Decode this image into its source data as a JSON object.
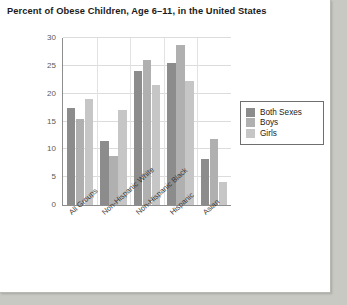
{
  "page": {
    "title": "Percent of Obese Children, Age 6–11, in the United States",
    "background": "#ffffff"
  },
  "chart_data": {
    "type": "bar",
    "title": "Percent of Obese Children, Age 6–11, in the United States",
    "xlabel": "",
    "ylabel": "",
    "ylim": [
      0,
      30
    ],
    "yticks": [
      0,
      5,
      10,
      15,
      20,
      25,
      30
    ],
    "ytick_labels": [
      "0",
      "5",
      "10",
      "15",
      "20",
      "25",
      "30"
    ],
    "grid": true,
    "legend_position": "right",
    "categories": [
      "All Groups",
      "Non-Hispanic White",
      "Non-Hispanic Black",
      "Hispanic",
      "Asian"
    ],
    "series": [
      {
        "name": "Both Sexes",
        "color": "#8c8c8c",
        "values": [
          17.5,
          11.5,
          24.0,
          25.5,
          8.3
        ]
      },
      {
        "name": "Boys",
        "color": "#b0b0b0",
        "values": [
          15.5,
          8.8,
          26.0,
          28.7,
          11.8
        ]
      },
      {
        "name": "Girls",
        "color": "#c6c6c6",
        "values": [
          19.0,
          17.0,
          21.5,
          22.3,
          4.1
        ]
      }
    ]
  }
}
